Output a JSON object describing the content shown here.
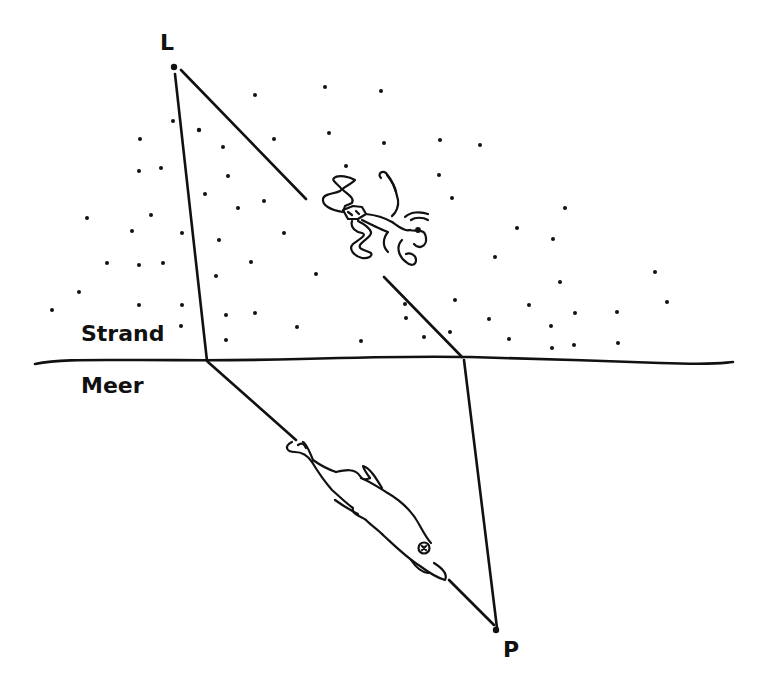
{
  "diagram": {
    "type": "hand-drawn refraction sketch",
    "labels": {
      "beach": "Strand",
      "sea": "Meer",
      "lifeguard_point": "L",
      "person_point": "P"
    },
    "points": {
      "L": {
        "x": 175,
        "y": 68
      },
      "P": {
        "x": 497,
        "y": 631
      }
    },
    "shoreline": {
      "y": 362,
      "x_start": 34,
      "x_end": 733
    },
    "paths": [
      {
        "name": "straight-path-via-runner",
        "from": "L",
        "via": [
          [
            305,
            198
          ],
          [
            385,
            277
          ]
        ],
        "to_shore": [
          461,
          357
        ],
        "to": "P"
      },
      {
        "name": "fast-run-path",
        "from": "L",
        "to_shore": [
          208,
          362
        ],
        "then_swim_to": "P"
      }
    ],
    "figures": [
      "running-person",
      "swimming-dolphin"
    ],
    "colors": {
      "ink": "#111111",
      "background": "#ffffff"
    }
  }
}
